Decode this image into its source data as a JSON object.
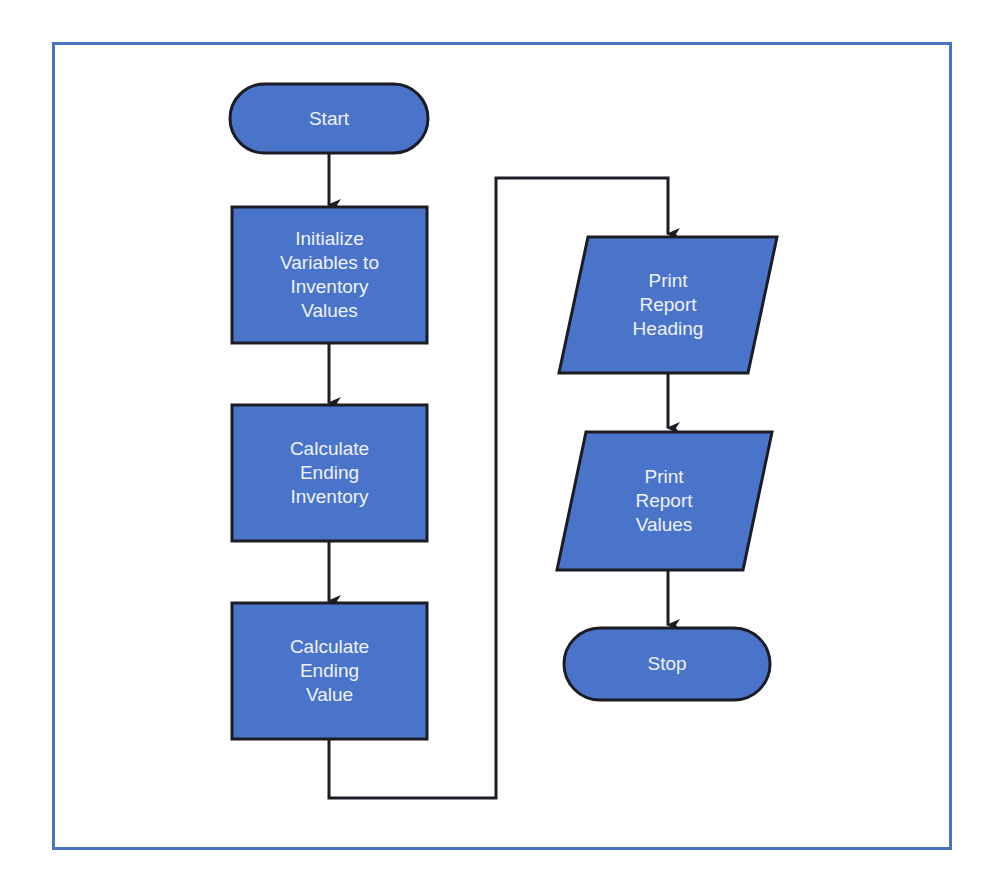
{
  "colors": {
    "frame": "#4a72c4",
    "fill": "#4a74c9",
    "stroke": "#1c1c24",
    "text": "#eef2fb"
  },
  "flowchart": {
    "nodes": [
      {
        "id": "start",
        "type": "terminator",
        "label": "Start"
      },
      {
        "id": "init",
        "type": "process",
        "label": "Initialize\nVariables to\nInventory\nValues"
      },
      {
        "id": "calc_inv",
        "type": "process",
        "label": "Calculate\nEnding\nInventory"
      },
      {
        "id": "calc_val",
        "type": "process",
        "label": "Calculate\nEnding\nValue"
      },
      {
        "id": "print_head",
        "type": "io",
        "label": "Print\nReport\nHeading"
      },
      {
        "id": "print_vals",
        "type": "io",
        "label": "Print\nReport\nValues"
      },
      {
        "id": "stop",
        "type": "terminator",
        "label": "Stop"
      }
    ],
    "edges": [
      {
        "from": "start",
        "to": "init"
      },
      {
        "from": "init",
        "to": "calc_inv"
      },
      {
        "from": "calc_inv",
        "to": "calc_val"
      },
      {
        "from": "calc_val",
        "to": "print_head"
      },
      {
        "from": "print_head",
        "to": "print_vals"
      },
      {
        "from": "print_vals",
        "to": "stop"
      }
    ]
  }
}
